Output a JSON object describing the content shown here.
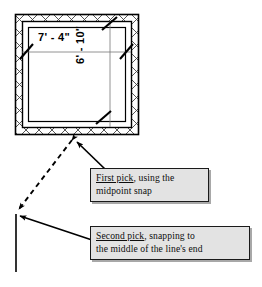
{
  "figure": {
    "background_color": "#ffffff",
    "ink_color": "#111111"
  },
  "plan": {
    "name": "room-plan",
    "wall_hatch": "crosshatch",
    "wall_fill": "#ffffff",
    "wall_outline_color": "#000000",
    "outer": {
      "x": 15,
      "y": 14,
      "width": 124,
      "height": 121
    },
    "inner": {
      "x": 22,
      "y": 21,
      "width": 110,
      "height": 107
    },
    "dimensions": {
      "horizontal": {
        "label": "7' - 4\"",
        "tick_style": "oblique-slash"
      },
      "vertical": {
        "label": "6' - 10\"",
        "tick_style": "oblique-slash",
        "rotation_degrees": -90
      }
    }
  },
  "callouts": [
    {
      "name": "callout-first-pick",
      "lead": "First pick",
      "rest": ", using the",
      "line2": "midpoint snap",
      "fill": "#e3e3e3",
      "border": "#1a1a1a",
      "shadow": "#a8a8a8",
      "leader_target": "bottom wall of plan",
      "leader_style": "solid-arrow"
    },
    {
      "name": "callout-second-pick",
      "lead": "Second pick",
      "rest": ", snapping to",
      "line2": "the middle of the line's end",
      "fill": "#e3e3e3",
      "border": "#1a1a1a",
      "shadow": "#a8a8a8",
      "leader_target": "top end of vertical line",
      "leader_style": "solid-arrow"
    }
  ],
  "measure_line": {
    "name": "dashed-measurement-line",
    "style": "dashed",
    "arrowheads": "both-ends",
    "from": {
      "x": 74,
      "y": 138
    },
    "to": {
      "x": 17,
      "y": 211
    },
    "color": "#000000"
  },
  "reference_line": {
    "name": "vertical-reference-line",
    "from": {
      "x": 16,
      "y": 214
    },
    "to": {
      "x": 16,
      "y": 272
    },
    "color": "#000000"
  }
}
